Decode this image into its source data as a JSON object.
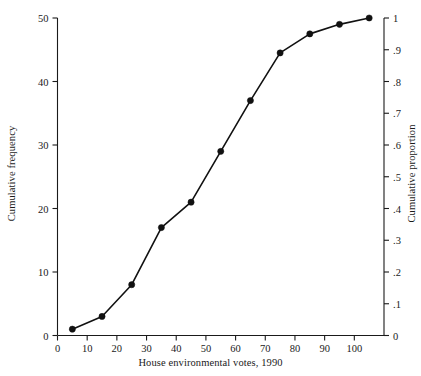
{
  "chart_data": {
    "type": "line",
    "title": "",
    "subtitle": "",
    "xlabel": "House environmental votes, 1990",
    "ylabel": "Cumulative frequency",
    "ylabel_right": "Cumulative proportion",
    "xlim": [
      0,
      110
    ],
    "ylim": [
      0,
      50
    ],
    "ylim_right": [
      0,
      1
    ],
    "grid": false,
    "legend": "none",
    "marker": "filled-circle",
    "line_color": "#111111",
    "x": [
      5,
      15,
      25,
      35,
      45,
      55,
      65,
      75,
      85,
      95,
      105
    ],
    "values": [
      1,
      3,
      8,
      17,
      21,
      29,
      37,
      44.5,
      47.5,
      49,
      50
    ],
    "proportion_values": [
      0.02,
      0.06,
      0.16,
      0.34,
      0.42,
      0.58,
      0.74,
      0.89,
      0.95,
      0.98,
      1.0
    ],
    "xticks": [
      0,
      10,
      20,
      30,
      40,
      50,
      60,
      70,
      80,
      90,
      100
    ],
    "xticklabels": [
      "0",
      "10",
      "20",
      "30",
      "40",
      "50",
      "60",
      "70",
      "80",
      "90",
      "100"
    ],
    "yticks": [
      0,
      10,
      20,
      30,
      40,
      50
    ],
    "yticklabels": [
      "0",
      "10",
      "20",
      "30",
      "40",
      "50"
    ],
    "yticks_right": [
      0,
      0.1,
      0.2,
      0.3,
      0.4,
      0.5,
      0.6,
      0.7,
      0.8,
      0.9,
      1.0
    ],
    "yticklabels_right": [
      "0",
      ".1",
      ".2",
      ".3",
      ".4",
      ".5",
      ".6",
      ".7",
      ".8",
      ".9",
      "1"
    ]
  }
}
